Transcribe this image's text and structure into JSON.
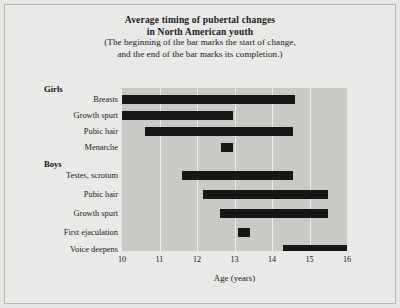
{
  "figure": {
    "title_lines": [
      "Average timing of pubertal changes",
      "in North American youth"
    ],
    "subtitle_lines": [
      "(The beginning of the bar marks the start of change,",
      "and the end of the bar marks its completion.)"
    ],
    "background_color": "#e9e9e7",
    "plot_background_color": "#c9c9c6",
    "bar_color": "#171717",
    "gridline_color": "#eeeeec"
  },
  "groups": [
    {
      "label": "Girls",
      "top": 84
    },
    {
      "label": "Boys",
      "top": 159
    }
  ],
  "xaxis": {
    "title": "Age (years)",
    "ticks": [
      "10",
      "11",
      "12",
      "13",
      "14",
      "15",
      "16"
    ]
  },
  "chart_data": {
    "type": "bar",
    "orientation": "horizontal",
    "title": "Average timing of pubertal changes in North American youth",
    "subtitle": "(The beginning of the bar marks the start of change, and the end of the bar marks its completion.)",
    "xlabel": "Age (years)",
    "ylabel": "",
    "xlim": [
      10,
      16
    ],
    "xticks": [
      10,
      11,
      12,
      13,
      14,
      15,
      16
    ],
    "grid": true,
    "legend": false,
    "groups": [
      "Girls",
      "Boys"
    ],
    "categories": [
      "Breasts",
      "Growth spurt",
      "Pubic hair",
      "Menarche",
      "Testes, scrotum",
      "Pubic hair",
      "Growth spurt",
      "First ejaculation",
      "Voice deepens"
    ],
    "bars": [
      {
        "group": "Girls",
        "label": "Breasts",
        "start": 10.0,
        "end": 14.6
      },
      {
        "group": "Girls",
        "label": "Growth spurt",
        "start": 10.0,
        "end": 12.95
      },
      {
        "group": "Girls",
        "label": "Pubic hair",
        "start": 10.6,
        "end": 14.55
      },
      {
        "group": "Girls",
        "label": "Menarche",
        "start": 12.65,
        "end": 12.95
      },
      {
        "group": "Boys",
        "label": "Testes, scrotum",
        "start": 11.6,
        "end": 14.55
      },
      {
        "group": "Boys",
        "label": "Pubic hair",
        "start": 12.15,
        "end": 15.5
      },
      {
        "group": "Boys",
        "label": "Growth spurt",
        "start": 12.6,
        "end": 15.5
      },
      {
        "group": "Boys",
        "label": "First ejaculation",
        "start": 13.1,
        "end": 13.4
      },
      {
        "group": "Boys",
        "label": "Voice deepens",
        "start": 14.3,
        "end": 16.0
      }
    ]
  }
}
